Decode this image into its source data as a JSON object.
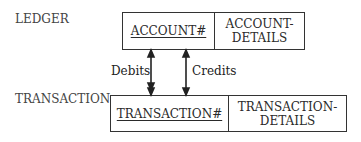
{
  "entities": [
    {
      "name": "LEDGER",
      "key": "ACCOUNT#",
      "details": [
        "ACCOUNT-",
        "DETAILS"
      ]
    },
    {
      "name": "TRANSACTION",
      "key": "TRANSACTION#",
      "details": [
        "TRANSACTION-",
        "DETAILS"
      ]
    }
  ],
  "relationships": [
    {
      "label": "Debits"
    },
    {
      "label": "Credits"
    }
  ]
}
